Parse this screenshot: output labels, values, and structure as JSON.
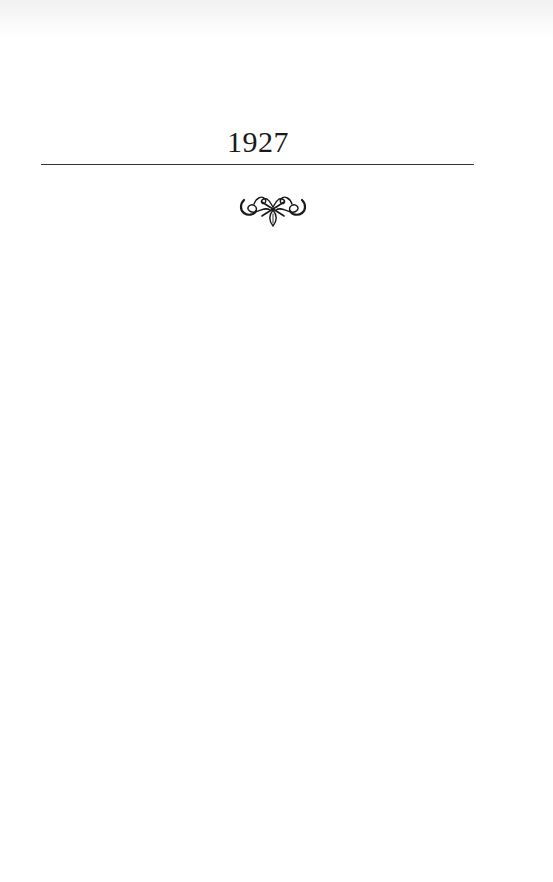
{
  "page": {
    "chapter_title": "1927",
    "ornament": "fleuron-icon"
  },
  "colors": {
    "text": "#1a1a1a",
    "rule": "#333333",
    "background": "#ffffff"
  }
}
